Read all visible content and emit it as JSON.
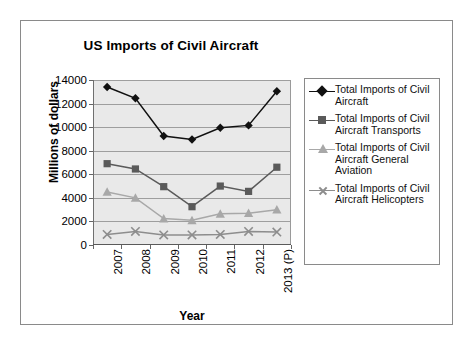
{
  "chart_data": {
    "type": "line",
    "title": "US Imports of Civil Aircraft",
    "xlabel": "Year",
    "ylabel": "Millions of dollars",
    "categories": [
      "2007",
      "2008",
      "2009",
      "2010",
      "2011",
      "2012",
      "2013 (P)"
    ],
    "ylim": [
      0,
      14000
    ],
    "yticks": [
      0,
      2000,
      4000,
      6000,
      8000,
      10000,
      12000,
      14000
    ],
    "ytick_labels": [
      "0",
      "2000",
      "4000",
      "6000",
      "8000",
      "10000",
      "12000",
      "14000"
    ],
    "grid": true,
    "legend_position": "right",
    "series": [
      {
        "name": "Total Imports of Civil Aircraft",
        "legend_label": "Total Imports of Civil\nAircraft",
        "marker": "diamond",
        "color": "#111111",
        "values": [
          13400,
          12450,
          9250,
          8950,
          9950,
          10150,
          13050
        ]
      },
      {
        "name": "Total Imports of Civil Aircraft Transports",
        "legend_label": "Total Imports of Civil\nAircraft Transports",
        "marker": "square",
        "color": "#5a5a5a",
        "values": [
          6900,
          6450,
          4950,
          3250,
          5000,
          4550,
          6600
        ]
      },
      {
        "name": "Total Imports of Civil Aircraft General Aviation",
        "legend_label": "Total Imports of Civil\nAircraft General\nAviation",
        "marker": "triangle",
        "color": "#a8a8a8",
        "values": [
          4500,
          4000,
          2250,
          2100,
          2650,
          2700,
          3000
        ]
      },
      {
        "name": "Total Imports of Civil Aircraft Helicopters",
        "legend_label": "Total Imports of Civil\nAircraft Helicopters",
        "marker": "x",
        "color": "#8d8d8d",
        "values": [
          900,
          1150,
          850,
          850,
          900,
          1150,
          1100
        ]
      }
    ]
  }
}
